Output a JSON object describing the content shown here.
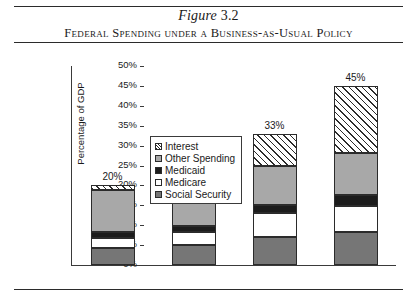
{
  "figure": {
    "number_prefix": "Figure",
    "number": "3.2",
    "title": "Federal Spending under a Business-as-Usual Policy"
  },
  "chart_data": {
    "type": "bar",
    "stacked": true,
    "title": "Federal Spending under a Business-as-Usual Policy",
    "xlabel": "",
    "ylabel": "Percentage of GDP",
    "categories": [
      "2005",
      "2015",
      "2030",
      "2040"
    ],
    "ylim": [
      0,
      50
    ],
    "ytick_labels": [
      "0%",
      "5%",
      "10%",
      "15%",
      "20%",
      "25%",
      "30%",
      "35%",
      "40%",
      "45%",
      "50%"
    ],
    "ytick_values": [
      0,
      5,
      10,
      15,
      20,
      25,
      30,
      35,
      40,
      45,
      50
    ],
    "grid": false,
    "legend_position": "upper-left-inside",
    "series": [
      {
        "name": "Social Security",
        "color": "#767676",
        "pattern": "solid",
        "values": [
          4.3,
          5.0,
          7.0,
          8.3
        ]
      },
      {
        "name": "Medicare",
        "color": "#ffffff",
        "pattern": "solid",
        "values": [
          2.5,
          3.3,
          6.0,
          6.5
        ]
      },
      {
        "name": "Medicaid",
        "color": "#1c1c1c",
        "pattern": "solid",
        "values": [
          1.5,
          1.5,
          2.2,
          2.7
        ]
      },
      {
        "name": "Other Spending",
        "color": "#a8a8a8",
        "pattern": "solid",
        "values": [
          10.5,
          12.0,
          9.8,
          10.7
        ]
      },
      {
        "name": "Interest",
        "color": "#ffffff",
        "pattern": "diagonal-hatch",
        "values": [
          1.2,
          1.2,
          8.0,
          16.8
        ]
      }
    ],
    "legend_order_top_to_bottom": [
      "Interest",
      "Other Spending",
      "Medicaid",
      "Medicare",
      "Social Security"
    ],
    "totals": [
      20,
      23,
      33,
      45
    ],
    "total_labels": [
      "20%",
      "23%",
      "33%",
      "45%"
    ]
  }
}
